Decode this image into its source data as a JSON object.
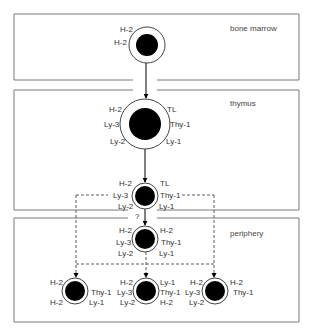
{
  "diagram": {
    "colors": {
      "line": "#7a7a7a",
      "nucleus": "#000000",
      "text": "#333333"
    },
    "regions": [
      {
        "name": "bone marrow",
        "label": "bone marrow",
        "x": 14,
        "y": 14,
        "w": 285,
        "h": 66,
        "label_x": 230,
        "label_y": 31,
        "gap_top": null,
        "gap_bottom": [
          133,
          157
        ]
      },
      {
        "name": "thymus",
        "label": "thymus",
        "x": 14,
        "y": 90,
        "w": 285,
        "h": 120,
        "label_x": 230,
        "label_y": 106,
        "gap_top": [
          133,
          157
        ],
        "gap_bottom": [
          128,
          157
        ]
      },
      {
        "name": "periphery",
        "label": "periphery",
        "x": 14,
        "y": 218,
        "w": 285,
        "h": 104,
        "label_x": 230,
        "label_y": 236,
        "gap_top": [
          128,
          157
        ],
        "gap_bottom": null
      }
    ],
    "cells": [
      {
        "id": "bone-marrow-precursor",
        "cx": 147,
        "cy": 45,
        "r_outer": 18,
        "r_inner": 11,
        "labels": [
          {
            "text": "H-2",
            "x": 120,
            "y": 32,
            "anchor": "start"
          },
          {
            "text": "H-2",
            "x": 114,
            "y": 45,
            "anchor": "start"
          }
        ]
      },
      {
        "id": "thymocyte-large",
        "cx": 145,
        "cy": 124,
        "r_outer": 25,
        "r_inner": 16,
        "labels": [
          {
            "text": "H-2",
            "x": 109,
            "y": 112,
            "anchor": "start"
          },
          {
            "text": "Ly-3",
            "x": 104,
            "y": 127,
            "anchor": "start"
          },
          {
            "text": "Ly-2",
            "x": 110,
            "y": 144,
            "anchor": "start"
          },
          {
            "text": "TL",
            "x": 167,
            "y": 112,
            "anchor": "start"
          },
          {
            "text": "Thy-1",
            "x": 170,
            "y": 127,
            "anchor": "start"
          },
          {
            "text": "Ly-1",
            "x": 166,
            "y": 144,
            "anchor": "start"
          }
        ]
      },
      {
        "id": "thymocyte-mature",
        "cx": 145,
        "cy": 196,
        "r_outer": 13,
        "r_inner": 10,
        "labels": [
          {
            "text": "H-2",
            "x": 119,
            "y": 186,
            "anchor": "start"
          },
          {
            "text": "Ly-3",
            "x": 113,
            "y": 198,
            "anchor": "start"
          },
          {
            "text": "Ly-2",
            "x": 118,
            "y": 209,
            "anchor": "start"
          },
          {
            "text": "TL",
            "x": 160,
            "y": 186,
            "anchor": "start"
          },
          {
            "text": "Thy-1",
            "x": 160,
            "y": 198,
            "anchor": "start"
          },
          {
            "text": "Ly-1",
            "x": 159,
            "y": 209,
            "anchor": "start"
          }
        ]
      },
      {
        "id": "peripheral-t-cell",
        "cx": 145,
        "cy": 239,
        "r_outer": 13,
        "r_inner": 10,
        "labels": [
          {
            "text": "H-2",
            "x": 119,
            "y": 233,
            "anchor": "start"
          },
          {
            "text": "Ly-3",
            "x": 116,
            "y": 245,
            "anchor": "start"
          },
          {
            "text": "Ly-2",
            "x": 118,
            "y": 256,
            "anchor": "start"
          },
          {
            "text": "H-2",
            "x": 160,
            "y": 233,
            "anchor": "start"
          },
          {
            "text": "Thy-1",
            "x": 161,
            "y": 245,
            "anchor": "start"
          },
          {
            "text": "Ly-1",
            "x": 159,
            "y": 256,
            "anchor": "start"
          }
        ]
      },
      {
        "id": "helper-t-cell",
        "cx": 75,
        "cy": 291,
        "r_outer": 13,
        "r_inner": 10,
        "labels": [
          {
            "text": "H-2",
            "x": 50,
            "y": 285,
            "anchor": "start"
          },
          {
            "text": "H-2",
            "x": 50,
            "y": 305,
            "anchor": "start"
          },
          {
            "text": "Thy-1",
            "x": 91,
            "y": 295,
            "anchor": "start"
          },
          {
            "text": "Ly-1",
            "x": 89,
            "y": 305,
            "anchor": "start"
          }
        ]
      },
      {
        "id": "ly123-t-cell",
        "cx": 146,
        "cy": 291,
        "r_outer": 13,
        "r_inner": 10,
        "labels": [
          {
            "text": "H-2",
            "x": 120,
            "y": 285,
            "anchor": "start"
          },
          {
            "text": "Ly-3",
            "x": 117,
            "y": 295,
            "anchor": "start"
          },
          {
            "text": "Ly-2",
            "x": 120,
            "y": 305,
            "anchor": "start"
          },
          {
            "text": "Ly-1",
            "x": 160,
            "y": 285,
            "anchor": "start"
          },
          {
            "text": "Thy-1",
            "x": 160,
            "y": 295,
            "anchor": "start"
          },
          {
            "text": "H-2",
            "x": 160,
            "y": 305,
            "anchor": "start"
          }
        ]
      },
      {
        "id": "killer-t-cell",
        "cx": 215,
        "cy": 291,
        "r_outer": 13,
        "r_inner": 10,
        "labels": [
          {
            "text": "H-2",
            "x": 190,
            "y": 285,
            "anchor": "start"
          },
          {
            "text": "Ly-3",
            "x": 185,
            "y": 295,
            "anchor": "start"
          },
          {
            "text": "Ly-2",
            "x": 189,
            "y": 305,
            "anchor": "start"
          },
          {
            "text": "H-2",
            "x": 230,
            "y": 285,
            "anchor": "start"
          },
          {
            "text": "Thy-1",
            "x": 233,
            "y": 295,
            "anchor": "start"
          }
        ]
      }
    ],
    "solid_arrows": [
      {
        "x1": 146,
        "y1": 63,
        "x2": 146,
        "y2": 98
      },
      {
        "x1": 145,
        "y1": 149,
        "x2": 145,
        "y2": 182
      },
      {
        "x1": 145,
        "y1": 209,
        "x2": 145,
        "y2": 225
      }
    ],
    "dashed_lines": [
      {
        "x1": 76,
        "y1": 195,
        "x2": 108,
        "y2": 195
      },
      {
        "x1": 182,
        "y1": 195,
        "x2": 214,
        "y2": 195
      },
      {
        "x1": 76,
        "y1": 195,
        "x2": 76,
        "y2": 274
      },
      {
        "x1": 214,
        "y1": 195,
        "x2": 214,
        "y2": 274
      },
      {
        "x1": 76,
        "y1": 264,
        "x2": 214,
        "y2": 264
      },
      {
        "x1": 146,
        "y1": 252,
        "x2": 146,
        "y2": 274
      }
    ],
    "dashed_arrowheads": [
      {
        "x": 76,
        "y": 278
      },
      {
        "x": 146,
        "y": 278
      },
      {
        "x": 214,
        "y": 278
      }
    ],
    "question_mark": {
      "text": "?",
      "x": 135,
      "y": 219
    }
  }
}
